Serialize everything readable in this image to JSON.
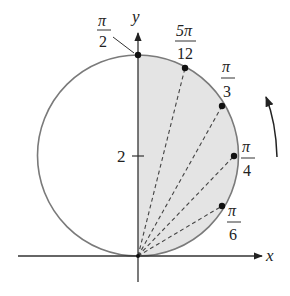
{
  "figure": {
    "axes": {
      "x_label": "x",
      "y_label": "y",
      "y_tick_label": "2"
    },
    "colors": {
      "curve": "#777777",
      "shade": "#e4e4e4",
      "axis": "#333333",
      "points": "#111111"
    },
    "angle_labels": [
      {
        "num": "π",
        "den": "2",
        "theta": "pi/2"
      },
      {
        "num": "5π",
        "den": "12",
        "theta": "5pi/12"
      },
      {
        "num": "π",
        "den": "3",
        "theta": "pi/3"
      },
      {
        "num": "π",
        "den": "4",
        "theta": "pi/4"
      },
      {
        "num": "π",
        "den": "6",
        "theta": "pi/6"
      }
    ],
    "direction_arrow": "counterclockwise"
  }
}
